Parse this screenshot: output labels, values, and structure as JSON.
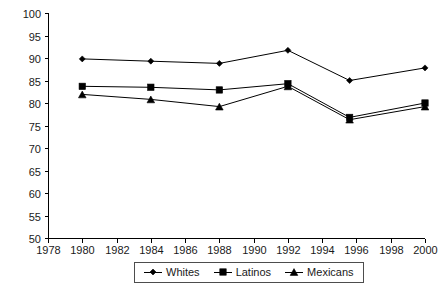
{
  "chart_data": {
    "type": "line",
    "title": "",
    "subtitle": "",
    "xlabel": "",
    "ylabel": "",
    "xlim": [
      1978,
      2000
    ],
    "ylim": [
      50,
      100
    ],
    "grid": false,
    "legend_position": "bottom-center",
    "x_tick_labels": [
      "1978",
      "1980",
      "1982",
      "1984",
      "1986",
      "1988",
      "1990",
      "1992",
      "1994",
      "1996",
      "1998",
      "2000"
    ],
    "y_tick_labels": [
      "50",
      "55",
      "60",
      "65",
      "70",
      "75",
      "80",
      "85",
      "90",
      "95",
      "100"
    ],
    "x_ticks": [
      1978,
      1980,
      1982,
      1984,
      1986,
      1988,
      1990,
      1992,
      1994,
      1996,
      1998,
      2000
    ],
    "y_ticks": [
      50,
      55,
      60,
      65,
      70,
      75,
      80,
      85,
      90,
      95,
      100
    ],
    "x": [
      1980,
      1984,
      1988,
      1992,
      1995.6,
      2000
    ],
    "series": [
      {
        "name": "Whites",
        "marker": "diamond",
        "color": "#000000",
        "values": [
          89.8,
          89.3,
          88.8,
          91.7,
          85.0,
          87.8
        ]
      },
      {
        "name": "Latinos",
        "marker": "square",
        "color": "#000000",
        "values": [
          83.7,
          83.5,
          82.9,
          84.3,
          76.8,
          80.0
        ]
      },
      {
        "name": "Mexicans",
        "marker": "triangle",
        "color": "#000000",
        "values": [
          81.9,
          80.8,
          79.2,
          83.7,
          76.3,
          79.2
        ]
      }
    ]
  },
  "legend": {
    "items": [
      {
        "label": "Whites",
        "marker": "diamond"
      },
      {
        "label": "Latinos",
        "marker": "square"
      },
      {
        "label": "Mexicans",
        "marker": "triangle"
      }
    ]
  }
}
